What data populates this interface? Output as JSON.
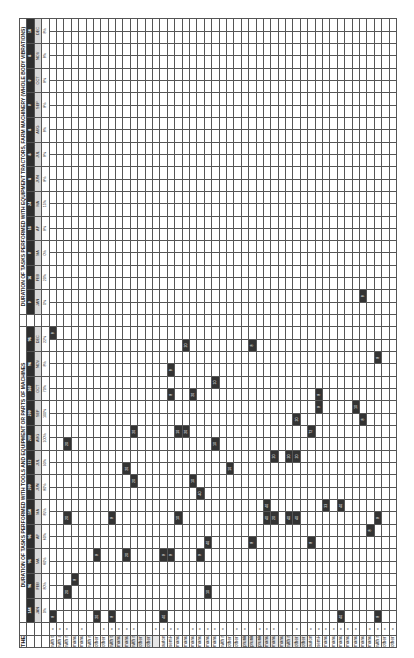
{
  "footer_note": "THE SUM TOTAL PER MONTH MUST ALWAYS ADD UP TO 100%",
  "sections": [
    {
      "title": "DURATION OF TASKS PERFORMED WITH TOOLS AND EQUIPMENT OR PARTS OF MACHINES",
      "months": [
        "JAN",
        "FEB",
        "MA",
        "AP",
        "MA",
        "JUN",
        "JUL",
        "AUG",
        "SEP",
        "OCT",
        "NOV",
        "DEC"
      ],
      "month_numbers": [
        "144",
        "96",
        "96",
        "96",
        "156",
        "200",
        "172",
        "200",
        "200",
        "160",
        "96",
        "96"
      ],
      "percentages": [
        "0%",
        "80%",
        "60%",
        "60%",
        "85%",
        "80%",
        "93%",
        "100%",
        "100%",
        "70%",
        "8%",
        "22%"
      ]
    },
    {
      "title": "DURATION OF TASKS PERFORMED WITH EQUIPMENT TRACTORS, FARM MACHINERY (WHOLE BODY VIBRATIONS)",
      "months": [
        "JAN",
        "FEB",
        "MA",
        "AP",
        "MA",
        "JUN",
        "JUL",
        "AUG",
        "SEP",
        "OCT",
        "NOV",
        "DEC"
      ],
      "month_numbers": [
        "0",
        "16",
        "0",
        "16",
        "24",
        "8",
        "8",
        "8",
        "0",
        "0",
        "8",
        "16"
      ],
      "percentages": [
        "0%",
        "20%",
        "0%",
        "8%",
        "15%",
        "8%",
        "8%",
        "8%",
        "8%",
        "8%",
        "8%",
        "8%"
      ]
    }
  ],
  "groups": [
    {
      "shade": "white",
      "rows": [
        {
          "label": "with tractor",
          "x": true,
          "cells": {
            "0": "8",
            "23": "8"
          }
        },
        {
          "label": "with animals",
          "x": true,
          "cells": {}
        },
        {
          "label": "with manual tools",
          "x": true,
          "cells": {
            "2": "20",
            "8": "20",
            "14": "20"
          }
        },
        {
          "label": "manual carrying (weight up to max. 3 kg)",
          "x": false,
          "cells": {
            "3": "8"
          }
        },
        {
          "label": "manual carrying (weight 3 kg)",
          "x": true,
          "cells": {}
        },
        {
          "label": "with manual tool and pulling/pushing",
          "x": false,
          "cells": {}
        },
        {
          "label": "other activities, without tools, with repetitive movements of the upper limbs (without lifting up to max. 3 kg)",
          "x": false,
          "cells": {
            "0": "20",
            "5": "8"
          }
        },
        {
          "label": "other activities, without tools, with repetitive movements of the upper limbs (with lifting up to max. 3 kg)",
          "x": true,
          "cells": {}
        }
      ]
    },
    {
      "shade": "gray",
      "rows": [
        {
          "label": "with tractor",
          "x": true,
          "cells": {
            "0": "8",
            "8": "8"
          }
        },
        {
          "label": "manual with machinery",
          "x": true,
          "cells": {}
        },
        {
          "label": "manual with tools",
          "x": true,
          "cells": {
            "5": "20",
            "12": "20"
          }
        },
        {
          "label": "with manual tools and pulling/pushing",
          "x": true,
          "cells": {
            "11": "20",
            "15": "20"
          }
        },
        {
          "label": "other activities, without tools, with repetitive movements of the upper limbs (without lifting up to max. 3 kg)",
          "x": false,
          "cells": {}
        },
        {
          "label": "other activities, without tools, with repetitive movements of the upper limbs (with lifting up to max. 3 kg)",
          "x": false,
          "cells": {}
        },
        {
          "label": "",
          "x": true,
          "cells": {}
        }
      ]
    },
    {
      "shade": "white",
      "rows": [
        {
          "label": "automatic with tractor",
          "x": true,
          "cells": {
            "0": "40",
            "5": "8"
          }
        },
        {
          "label": "semi-automatic with tools and/or machinery",
          "x": true,
          "cells": {
            "5": "8",
            "18": "8",
            "20": "8"
          }
        },
        {
          "label": "manual with manual tool (product weight up to max. 3 kg)",
          "x": true,
          "cells": {
            "8": "10",
            "15": "10"
          }
        },
        {
          "label": "manual without tools (product weight up to max. 3 kg)",
          "x": false,
          "cells": {
            "15": "20",
            "22": "20"
          }
        },
        {
          "label": "manual with manual tool (product weight over 3 kg)",
          "x": true,
          "cells": {
            "11": "10",
            "18": "20"
          }
        },
        {
          "label": "manual without tools (product weight over 3 kg)",
          "x": true,
          "cells": {
            "5": "8",
            "10": "40"
          }
        },
        {
          "label": "manual carrying product weight up to max. 3 kg",
          "x": true,
          "cells": {
            "2": "10",
            "6": "40"
          }
        },
        {
          "label": "manual carrying product weight above 3 kg",
          "x": true,
          "cells": {
            "14": "10",
            "19": "10"
          }
        },
        {
          "label": "with manual tool and pulling/pushing",
          "x": true,
          "cells": {}
        },
        {
          "label": "other activities, without tools, with repetitive movements of the upper limbs (without lifting up to max. 3 kg)",
          "x": false,
          "cells": {
            "12": "10"
          }
        },
        {
          "label": "other activities, without tools, with repetitive movements of the upper limbs (with lifting up to max. 3 kg)",
          "x": true,
          "cells": {}
        }
      ]
    },
    {
      "shade": "gray",
      "rows": [
        {
          "label": "pruning with manual tools",
          "x": true,
          "cells": {}
        },
        {
          "label": "pruning with pneumatic/electric tools",
          "x": false,
          "cells": {
            "6": "8",
            "22": "8"
          }
        },
        {
          "label": "pruning with chainsaw",
          "x": true,
          "cells": {}
        },
        {
          "label": "manual pruning without tools",
          "x": true,
          "cells": {
            "8": "40",
            "9": "40"
          }
        },
        {
          "label": "manual carrying (weight up to max. 3 kg)",
          "x": true,
          "cells": {
            "8": "20",
            "13": "20"
          }
        },
        {
          "label": "manual carrying (weight 3 kg)",
          "x": false,
          "cells": {}
        },
        {
          "label": "with manual tool and pulling/pushing",
          "x": false,
          "cells": {
            "8": "40",
            "13": "20"
          }
        },
        {
          "label": "other activities, without tools, with repetitive movements of the upper limbs (without lifting up to max. 3 kg)",
          "x": true,
          "cells": {
            "8": "40",
            "13": "20",
            "16": "20"
          }
        },
        {
          "label": "other activities, without tools, with repetitive movements of the upper limbs (with lifting up to max. 3 kg)",
          "x": false,
          "cells": {}
        }
      ]
    },
    {
      "shade": "white",
      "rows": [
        {
          "label": "automatic with tractor",
          "x": true,
          "cells": {
            "6": "8",
            "15": "72"
          }
        },
        {
          "label": "semi-automatic with tools and/or machinery",
          "x": true,
          "cells": {
            "17": "8",
            "18": "8"
          }
        },
        {
          "label": "manual with manual tool",
          "x": true,
          "cells": {
            "9": "33"
          }
        },
        {
          "label": "manual with pneumatic/electric tools",
          "x": true,
          "cells": {}
        },
        {
          "label": "manual with chainsaw",
          "x": true,
          "cells": {
            "0": "40",
            "9": "40"
          }
        },
        {
          "label": "manual with animals",
          "x": true,
          "cells": {}
        },
        {
          "label": "manual without tools",
          "x": true,
          "cells": {
            "17": "10"
          }
        },
        {
          "label": "manual carrying (weight up to max. 3 kg)",
          "x": false,
          "cells": {
            "16": "8",
            "25": "8"
          }
        },
        {
          "label": "manual carrying (weight 3 kg)",
          "x": true,
          "cells": {
            "7": "8"
          }
        },
        {
          "label": "with manual tool and pulling/pushing",
          "x": true,
          "cells": {
            "0": "8",
            "8": "8",
            "21": "8"
          }
        },
        {
          "label": "other activities, without tools, with repetitive movements of the upper limbs (without lifting up to max. 3 kg)",
          "x": true,
          "cells": {}
        },
        {
          "label": "other activities, without tools, with repetitive movements of the upper limbs (with lifting up to max. 3 kg)",
          "x": true,
          "cells": {}
        }
      ]
    }
  ],
  "grid": {
    "columns": 48,
    "colors": {
      "filled": "#333333",
      "shade": "#e6e6e6",
      "line": "#555555",
      "header_dark": "#2e2e2e",
      "header_light": "#d8d8d8"
    }
  }
}
